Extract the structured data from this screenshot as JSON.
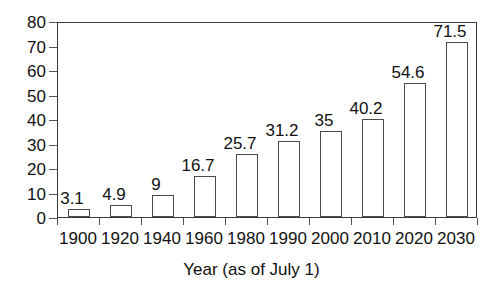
{
  "chart_data": {
    "type": "bar",
    "title": "",
    "xlabel": "Year (as of July 1)",
    "ylabel": "",
    "categories": [
      "1900",
      "1920",
      "1940",
      "1960",
      "1980",
      "1990",
      "2000",
      "2010",
      "2020",
      "2030"
    ],
    "values": [
      3.1,
      4.9,
      9,
      16.7,
      25.7,
      31.2,
      35,
      40.2,
      54.6,
      71.5
    ],
    "value_labels": [
      "3.1",
      "4.9",
      "9",
      "16.7",
      "25.7",
      "31.2",
      "35",
      "40.2",
      "54.6",
      "71.5"
    ],
    "ylim": [
      0,
      80
    ],
    "ytick_labels": [
      "0",
      "10",
      "20",
      "30",
      "40",
      "50",
      "60",
      "70",
      "80"
    ],
    "ytick_values": [
      0,
      10,
      20,
      30,
      40,
      50,
      60,
      70,
      80
    ],
    "grid": false,
    "legend": null,
    "legend_position": "none",
    "bar_fill_color": "#ffffff",
    "bar_border_color": "#4a4a4a",
    "axis_color": "#3a3a3a",
    "text_color": "#111111",
    "background_color": "#ffffff"
  }
}
